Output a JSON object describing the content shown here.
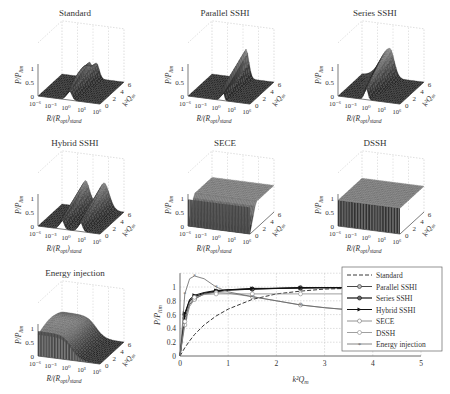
{
  "chart_data": [
    {
      "type": "surface",
      "title": "Standard",
      "xlabel": "R/(R_opt)_stand",
      "ylabel": "k^2 Q_m",
      "zlabel": "P/P_lim",
      "x_ticks": [
        "10^-6",
        "10^-3",
        "10^0",
        "10^3",
        "10^6"
      ],
      "y_ticks": [
        "0",
        "2",
        "4",
        "6"
      ],
      "z_ticks": [
        "0",
        "0.5",
        "1"
      ],
      "description": "Flat near zero except a ridge near R/(R_opt)_stand = 10^0 splitting into two peaks (~1) at high k^2 Q_m"
    },
    {
      "type": "surface",
      "title": "Parallel SSHI",
      "xlabel": "R/(R_opt)_stand",
      "ylabel": "k^2 Q_m",
      "zlabel": "P/P_lim",
      "x_ticks": [
        "10^-6",
        "10^-3",
        "10^0",
        "10^3",
        "10^6"
      ],
      "y_ticks": [
        "0",
        "2",
        "4",
        "6"
      ],
      "z_ticks": [
        "0",
        "0.5",
        "1"
      ],
      "description": "Narrow single sharp peak slightly right of 10^0"
    },
    {
      "type": "surface",
      "title": "Series SSHI",
      "xlabel": "R/(R_opt)_stand",
      "ylabel": "k^2 Q_m",
      "zlabel": "P/P_lim",
      "x_ticks": [
        "10^-6",
        "10^-3",
        "10^0",
        "10^3",
        "10^6"
      ],
      "y_ticks": [
        "0",
        "2",
        "4",
        "6"
      ],
      "z_ticks": [
        "0",
        "0.5",
        "1"
      ],
      "description": "Single peak slightly left of 10^0, broad on the low-R side"
    },
    {
      "type": "surface",
      "title": "Hybrid SSHI",
      "xlabel": "R/(R_opt)_stand",
      "ylabel": "k^2 Q_m",
      "zlabel": "P/P_lim",
      "x_ticks": [
        "10^-6",
        "10^-3",
        "10^0",
        "10^3",
        "10^6"
      ],
      "y_ticks": [
        "0",
        "2",
        "4",
        "6"
      ],
      "z_ticks": [
        "0",
        "0.5",
        "1"
      ],
      "description": "Two distinct peaks on either side of 10^0"
    },
    {
      "type": "surface",
      "title": "SECE",
      "xlabel": "R/(R_opt)_stand",
      "ylabel": "k^2 Q_m",
      "zlabel": "P/P_lim",
      "x_ticks": [
        "10^-6",
        "10^-3",
        "10^0",
        "10^3",
        "10^6"
      ],
      "y_ticks": [
        "0",
        "2",
        "4",
        "6"
      ],
      "z_ticks": [
        "0",
        "0.5",
        "1"
      ],
      "description": "Load-independent plateau ~1 for most k^2 Q_m, dropping off at low k^2 Q_m"
    },
    {
      "type": "surface",
      "title": "DSSH",
      "xlabel": "R/(R_opt)_stand",
      "ylabel": "k^2 Q_m",
      "zlabel": "P/P_lim",
      "x_ticks": [
        "10^-6",
        "10^-3",
        "10^0",
        "10^3",
        "10^6"
      ],
      "y_ticks": [
        "0",
        "2",
        "4",
        "6"
      ],
      "z_ticks": [
        "0",
        "0.5",
        "1"
      ],
      "description": "Flat plateau ~0.9-1 over all loads and coupling"
    },
    {
      "type": "surface",
      "title": "Energy injection",
      "xlabel": "R/(R_opt)_stand",
      "ylabel": "k^2 Q_m",
      "zlabel": "P/P_lim",
      "x_ticks": [
        "10^-6",
        "10^-3",
        "10^0",
        "10^3",
        "10^6"
      ],
      "y_ticks": [
        "0",
        "2",
        "4",
        "6"
      ],
      "z_ticks": [
        "0",
        "0.5",
        "1"
      ],
      "description": "High plateau ~1 for low R, rolling off to ~0 for high R"
    },
    {
      "type": "line",
      "title": "",
      "xlabel": "k^2 Q_m",
      "ylabel": "P/P_lim",
      "xlim": [
        0,
        5
      ],
      "ylim": [
        0,
        1.2
      ],
      "x_ticks": [
        "0",
        "1",
        "2",
        "3",
        "4",
        "5"
      ],
      "y_ticks": [
        "0",
        "0.2",
        "0.4",
        "0.6",
        "0.8",
        "1"
      ],
      "grid": true,
      "legend_position": "right",
      "x": [
        0,
        0.1,
        0.2,
        0.3,
        0.5,
        0.75,
        1,
        1.5,
        2,
        2.5,
        3,
        3.5
      ],
      "series": [
        {
          "name": "Standard",
          "style": "dashed",
          "values": [
            0,
            0.12,
            0.22,
            0.31,
            0.45,
            0.58,
            0.68,
            0.82,
            0.9,
            0.94,
            0.97,
            0.98
          ]
        },
        {
          "name": "Parallel SSHI",
          "style": "solid-circle",
          "values": [
            0,
            0.55,
            0.75,
            0.83,
            0.9,
            0.93,
            0.95,
            0.97,
            0.98,
            0.98,
            0.99,
            0.99
          ]
        },
        {
          "name": "Series SSHI",
          "style": "solid-circle-bold",
          "values": [
            0,
            0.6,
            0.8,
            0.86,
            0.91,
            0.94,
            0.96,
            0.97,
            0.98,
            0.99,
            0.99,
            0.99
          ]
        },
        {
          "name": "Hybrid SSHI",
          "style": "solid-triangle",
          "values": [
            0,
            0.62,
            0.82,
            0.88,
            0.92,
            0.95,
            0.96,
            0.98,
            0.98,
            0.99,
            0.99,
            0.99
          ]
        },
        {
          "name": "SECE",
          "style": "light-circle",
          "values": [
            0,
            0.45,
            0.72,
            0.82,
            0.9,
            0.92,
            0.91,
            0.86,
            0.8,
            0.74,
            0.7,
            0.67
          ]
        },
        {
          "name": "DSSH",
          "style": "light-circle",
          "values": [
            0,
            0.5,
            0.78,
            0.85,
            0.89,
            0.9,
            0.9,
            0.9,
            0.9,
            0.9,
            0.9,
            0.9
          ]
        },
        {
          "name": "Energy injection",
          "style": "light-star",
          "values": [
            0,
            0.9,
            1.12,
            1.16,
            1.12,
            1.0,
            0.93,
            0.86,
            0.8,
            0.74,
            0.7,
            0.67
          ]
        }
      ]
    }
  ],
  "legend": {
    "items": [
      {
        "label": "Standard"
      },
      {
        "label": "Parallel SSHI"
      },
      {
        "label": "Series SSHI"
      },
      {
        "label": "Hybrid SSHI"
      },
      {
        "label": "SECE"
      },
      {
        "label": "DSSH"
      },
      {
        "label": "Energy injection"
      }
    ]
  },
  "axis_text": {
    "z_label": "P/P",
    "z_sub": "lim",
    "x_label": "R/(R",
    "x_sub": "opt",
    "x_label2": ")",
    "x_sub2": "stand",
    "y_label": "k²Q",
    "y_sub": "m",
    "x3d_ticks": [
      "10⁻⁶",
      "10⁻³",
      "10⁰",
      "10³",
      "10⁶"
    ],
    "y3d_ticks": [
      "0",
      "2",
      "4",
      "6"
    ],
    "z3d_ticks": [
      "0",
      "0.5",
      "1"
    ],
    "x2d_ticks": [
      "0",
      "1",
      "2",
      "3",
      "4",
      "5"
    ],
    "y2d_ticks": [
      "0",
      "0.2",
      "0.4",
      "0.6",
      "0.8",
      "1"
    ],
    "x2d_label": "k²Q",
    "x2d_sub": "m"
  }
}
